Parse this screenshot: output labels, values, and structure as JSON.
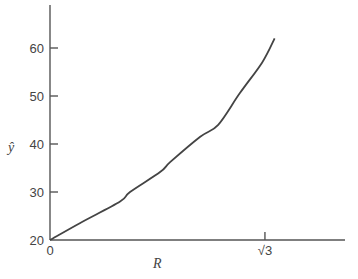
{
  "chart_data": {
    "type": "line",
    "title": "",
    "xlabel": "R",
    "ylabel": "ŷ",
    "xlim": [
      0,
      2.35
    ],
    "ylim": [
      20,
      69
    ],
    "grid": false,
    "legend": null,
    "x_ticks": [
      {
        "value": 0,
        "label": "0"
      },
      {
        "value": 1.732,
        "label": "√3"
      }
    ],
    "y_ticks": [
      {
        "value": 20,
        "label": "20"
      },
      {
        "value": 30,
        "label": "30"
      },
      {
        "value": 40,
        "label": "40"
      },
      {
        "value": 50,
        "label": "50"
      },
      {
        "value": 60,
        "label": "60"
      }
    ],
    "series": [
      {
        "name": "ŷ(R)",
        "x": [
          0,
          0.24,
          0.565,
          0.645,
          0.89,
          0.968,
          1.21,
          1.355,
          1.53,
          1.71,
          1.81
        ],
        "values": [
          20,
          23.5,
          28,
          30,
          34.2,
          36.2,
          41.5,
          44,
          50.6,
          57,
          62
        ]
      }
    ]
  }
}
